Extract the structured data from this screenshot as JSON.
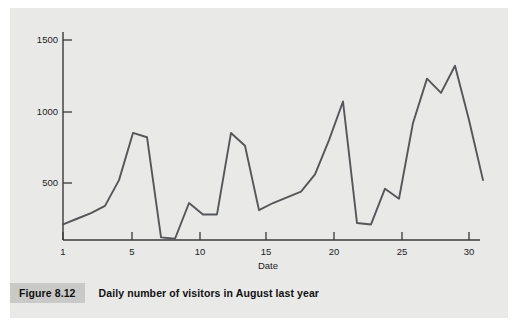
{
  "figure": {
    "tag": "Figure 8.12",
    "caption": "Daily number of visitors in August last year"
  },
  "colors": {
    "plate_background": "#e9e9e7",
    "line": "#55565a",
    "axis": "#3a3a3c",
    "text": "#111111",
    "caption_tag_background": "#c9c9c7"
  },
  "chart_data": {
    "type": "line",
    "title": "Daily number of visitors in August last year",
    "xlabel": "Date",
    "ylabel": "",
    "xlim": [
      1,
      31
    ],
    "ylim": [
      0,
      1600
    ],
    "xticks": [
      1,
      5,
      10,
      15,
      20,
      25,
      30
    ],
    "yticks": [
      500,
      1000,
      1500
    ],
    "xtick_labels": [
      "1",
      "5",
      "10",
      "15",
      "20",
      "25",
      "30"
    ],
    "ytick_labels": [
      "500",
      "1000",
      "1500"
    ],
    "grid": false,
    "legend": false,
    "x": [
      1,
      2,
      3,
      4,
      5,
      6,
      7,
      8,
      9,
      10,
      11,
      12,
      13,
      14,
      15,
      16,
      17,
      18,
      19,
      20,
      21,
      22,
      23,
      24,
      25,
      26,
      27,
      28,
      29,
      30,
      31
    ],
    "values": [
      210,
      250,
      290,
      340,
      520,
      850,
      820,
      120,
      110,
      360,
      280,
      280,
      850,
      760,
      310,
      360,
      400,
      440,
      560,
      800,
      1070,
      220,
      210,
      460,
      390,
      920,
      1230,
      1130,
      1320,
      940,
      520
    ],
    "series": [
      {
        "name": "Daily visitors",
        "values": [
          210,
          250,
          290,
          340,
          520,
          850,
          820,
          120,
          110,
          360,
          280,
          280,
          850,
          760,
          310,
          360,
          400,
          440,
          560,
          800,
          1070,
          220,
          210,
          460,
          390,
          920,
          1230,
          1130,
          1320,
          940,
          520
        ]
      }
    ]
  }
}
